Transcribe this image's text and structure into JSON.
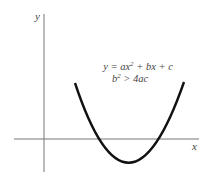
{
  "diagram": {
    "axes": {
      "x_label": "x",
      "y_label": "y"
    },
    "equation": {
      "line1_prefix": "y = ax",
      "line1_exp": "2",
      "line1_suffix": " + bx + c",
      "line2_base": "b",
      "line2_exp": "2",
      "line2_suffix": " > 4ac"
    },
    "curve": {
      "type": "parabola",
      "opens": "up",
      "vertex_below_x_axis": true,
      "real_roots": 2
    },
    "colors": {
      "axes": "#777777",
      "curve": "#111111",
      "text": "#444444"
    }
  }
}
